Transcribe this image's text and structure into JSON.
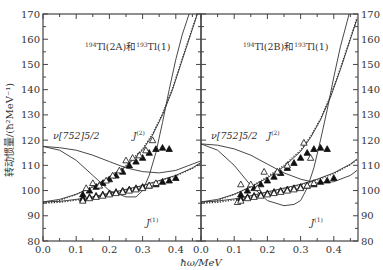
{
  "chart_data": [
    {
      "type": "scatter",
      "title": "194Tl(2A)和193Tl(1)",
      "title_parts": {
        "a_sup": "194",
        "a": "Tl(2A)和",
        "b_sup": "193",
        "b": "Tl(1)"
      },
      "xlabel": "ħω/MeV",
      "ylabel": "转动惯量/(ħ²MeV⁻¹)",
      "xlim": [
        0.0,
        0.48
      ],
      "ylim": [
        80,
        170
      ],
      "xticks": [
        "0.0",
        "0.1",
        "0.2",
        "0.3",
        "0.4"
      ],
      "yticks": [
        "80",
        "90",
        "100",
        "110",
        "120",
        "130",
        "140",
        "150",
        "160",
        "170"
      ],
      "yaxis_side": "left",
      "annotations": [
        {
          "text": "ν[752]5/2",
          "x": 0.03,
          "y": 120.5
        },
        {
          "text": "J(2)",
          "x": 0.27,
          "y": 120.5
        },
        {
          "text": "J(1)",
          "x": 0.31,
          "y": 86
        }
      ],
      "series": [
        {
          "name": "J(2) filled",
          "marker": "filled-triangle",
          "x": [
            0.12,
            0.14,
            0.16,
            0.18,
            0.2,
            0.22,
            0.24,
            0.26,
            0.28,
            0.3,
            0.32,
            0.34,
            0.36,
            0.38
          ],
          "y": [
            98.5,
            100,
            101.5,
            103,
            104.5,
            106,
            107.5,
            110,
            111.5,
            113,
            115,
            116.5,
            117,
            116.5
          ]
        },
        {
          "name": "J(2) open",
          "marker": "open-triangle",
          "x": [
            0.12,
            0.13,
            0.15,
            0.17,
            0.19,
            0.21,
            0.23,
            0.25,
            0.27,
            0.29,
            0.31,
            0.33
          ],
          "y": [
            96.5,
            101,
            103,
            102,
            104,
            106,
            108,
            112,
            113,
            114,
            116,
            120
          ]
        },
        {
          "name": "J(1) filled",
          "marker": "filled-triangle",
          "x": [
            0.12,
            0.14,
            0.16,
            0.18,
            0.2,
            0.22,
            0.24,
            0.26,
            0.28,
            0.3,
            0.32,
            0.34,
            0.36,
            0.38,
            0.4
          ],
          "y": [
            97,
            97.5,
            98,
            98.5,
            99,
            99.5,
            100,
            100.5,
            101,
            101.5,
            102,
            102.5,
            103.5,
            104,
            105
          ]
        },
        {
          "name": "J(1) open",
          "marker": "open-triangle",
          "x": [
            0.12,
            0.14,
            0.16,
            0.18,
            0.2,
            0.22,
            0.24,
            0.26,
            0.28,
            0.3,
            0.32,
            0.34
          ],
          "y": [
            96,
            97,
            97.5,
            98,
            98.5,
            99,
            99.5,
            100,
            100.5,
            101,
            102,
            103
          ]
        }
      ],
      "curves": [
        {
          "name": "ν[752]5/2 J(1)",
          "style": "solid",
          "x": [
            0.0,
            0.05,
            0.1,
            0.15,
            0.2,
            0.25,
            0.3,
            0.35,
            0.4,
            0.45,
            0.48
          ],
          "y": [
            117.5,
            117,
            116,
            114,
            111.5,
            109,
            107.5,
            107,
            108,
            110.5,
            112
          ]
        },
        {
          "name": "ν[752]5/2 J(2)",
          "style": "solid",
          "x": [
            0.0,
            0.05,
            0.1,
            0.15,
            0.2,
            0.25,
            0.28,
            0.3,
            0.32,
            0.34,
            0.36,
            0.38,
            0.4,
            0.42,
            0.44,
            0.46,
            0.48
          ],
          "y": [
            117.5,
            116,
            112,
            106,
            100,
            97.5,
            97.5,
            100,
            106,
            115,
            127,
            140,
            152,
            162,
            170,
            178,
            186
          ]
        },
        {
          "name": "J(1) fit",
          "style": "solid",
          "x": [
            0.0,
            0.05,
            0.1,
            0.15,
            0.2,
            0.25,
            0.3,
            0.35,
            0.4,
            0.45,
            0.48
          ],
          "y": [
            95.5,
            95.7,
            96.5,
            97.5,
            99,
            100.5,
            102,
            104,
            106,
            109,
            111.5
          ]
        },
        {
          "name": "J(1) fit dotted",
          "style": "dotted",
          "x": [
            0.0,
            0.05,
            0.1,
            0.15,
            0.2,
            0.25,
            0.3,
            0.35,
            0.4,
            0.45,
            0.48
          ],
          "y": [
            95,
            95.3,
            96.2,
            97.3,
            98.8,
            100.3,
            101.8,
            103.8,
            105.8,
            108.8,
            111.2
          ]
        },
        {
          "name": "J(2) fit",
          "style": "solid",
          "x": [
            0.0,
            0.05,
            0.1,
            0.15,
            0.2,
            0.25,
            0.3,
            0.33,
            0.36,
            0.39,
            0.42,
            0.45,
            0.48
          ],
          "y": [
            95.5,
            96.5,
            98.5,
            101.5,
            105,
            109.5,
            116,
            122,
            130,
            140,
            152,
            164,
            176
          ]
        },
        {
          "name": "J(2) fit dotted",
          "style": "dotted",
          "x": [
            0.0,
            0.05,
            0.1,
            0.15,
            0.2,
            0.25,
            0.3,
            0.33,
            0.36,
            0.39,
            0.42,
            0.45,
            0.48
          ],
          "y": [
            95,
            96,
            98.5,
            101.5,
            105.5,
            110,
            116.5,
            122.5,
            130.5,
            140.5,
            152.5,
            164.5,
            176.5
          ]
        }
      ]
    },
    {
      "type": "scatter",
      "title": "194Tl(2B)和193Tl(1)",
      "title_parts": {
        "a_sup": "194",
        "a": "Tl(2B)和",
        "b_sup": "193",
        "b": "Tl(1)"
      },
      "xlabel": "ħω/MeV",
      "ylabel": "",
      "xlim": [
        0.0,
        0.47
      ],
      "ylim": [
        80,
        170
      ],
      "xticks": [
        "0.0",
        "0.1",
        "0.2",
        "0.3",
        "0.4"
      ],
      "yticks": [
        "80",
        "90",
        "100",
        "110",
        "120",
        "130",
        "140",
        "150",
        "160",
        "170"
      ],
      "yaxis_side": "right",
      "annotations": [
        {
          "text": "ν[752]5/2",
          "x": 0.03,
          "y": 120.5
        },
        {
          "text": "J(2)",
          "x": 0.2,
          "y": 120.5
        },
        {
          "text": "J(1)",
          "x": 0.33,
          "y": 86
        }
      ],
      "series": [
        {
          "name": "J(2) filled",
          "marker": "filled-triangle",
          "x": [
            0.12,
            0.14,
            0.16,
            0.18,
            0.2,
            0.22,
            0.24,
            0.26,
            0.28,
            0.3,
            0.32,
            0.34,
            0.36,
            0.38
          ],
          "y": [
            98.5,
            100,
            101,
            102.5,
            104,
            105.5,
            107,
            109,
            111,
            113,
            115,
            116.5,
            117,
            116.5
          ]
        },
        {
          "name": "J(2) open",
          "marker": "open-triangle",
          "x": [
            0.11,
            0.12,
            0.15,
            0.17,
            0.19,
            0.23,
            0.26,
            0.31,
            0.33
          ],
          "y": [
            95.5,
            102.5,
            102.5,
            101,
            107.5,
            107.5,
            110,
            119,
            113
          ]
        },
        {
          "name": "J(1) filled",
          "marker": "filled-triangle",
          "x": [
            0.12,
            0.14,
            0.16,
            0.18,
            0.2,
            0.22,
            0.24,
            0.26,
            0.28,
            0.3,
            0.32,
            0.34,
            0.36,
            0.38,
            0.4
          ],
          "y": [
            97,
            97.5,
            98,
            98.5,
            99,
            99.5,
            100,
            100.5,
            101,
            101.5,
            102,
            102.5,
            103.5,
            104,
            105
          ]
        },
        {
          "name": "J(1) open",
          "marker": "open-triangle",
          "x": [
            0.12,
            0.14,
            0.16,
            0.18,
            0.2,
            0.22,
            0.24,
            0.26,
            0.28,
            0.3,
            0.32,
            0.34
          ],
          "y": [
            96,
            97,
            97.5,
            98,
            98.5,
            99,
            99.5,
            100,
            100.5,
            101,
            102,
            103
          ]
        }
      ],
      "curves": [
        {
          "name": "ν[752]5/2 J(1)",
          "style": "solid",
          "x": [
            0.0,
            0.05,
            0.1,
            0.15,
            0.2,
            0.25,
            0.3,
            0.35,
            0.4,
            0.45,
            0.47
          ],
          "y": [
            118.5,
            118,
            116.5,
            114,
            110.5,
            107,
            104.5,
            103,
            103.5,
            106,
            108
          ]
        },
        {
          "name": "ν[752]5/2 J(2)",
          "style": "solid",
          "x": [
            0.0,
            0.05,
            0.1,
            0.15,
            0.2,
            0.25,
            0.28,
            0.3,
            0.32,
            0.34,
            0.36,
            0.38,
            0.4,
            0.42,
            0.44,
            0.46,
            0.47
          ],
          "y": [
            118.5,
            116,
            110,
            102,
            96,
            94,
            94.5,
            96,
            101,
            109,
            120,
            132,
            145,
            157,
            167,
            177,
            182
          ]
        },
        {
          "name": "J(1) fit",
          "style": "solid",
          "x": [
            0.0,
            0.05,
            0.1,
            0.15,
            0.2,
            0.25,
            0.3,
            0.35,
            0.4,
            0.45,
            0.47
          ],
          "y": [
            95.5,
            95.8,
            96.7,
            98,
            99.5,
            101,
            102.5,
            104.5,
            107,
            110.5,
            112.5
          ]
        },
        {
          "name": "J(1) fit dotted",
          "style": "dotted",
          "x": [
            0.0,
            0.05,
            0.1,
            0.15,
            0.2,
            0.25,
            0.3,
            0.35,
            0.4,
            0.45,
            0.47
          ],
          "y": [
            95,
            95.3,
            96.3,
            97.6,
            99.1,
            100.7,
            102.2,
            104.2,
            106.7,
            110.2,
            112.2
          ]
        },
        {
          "name": "J(2) fit",
          "style": "solid",
          "x": [
            0.0,
            0.05,
            0.1,
            0.15,
            0.2,
            0.25,
            0.3,
            0.33,
            0.36,
            0.39,
            0.42,
            0.45,
            0.47
          ],
          "y": [
            95.5,
            96.5,
            98.5,
            101.5,
            105,
            109.5,
            115.5,
            121,
            128,
            137,
            148,
            160,
            168
          ]
        },
        {
          "name": "J(2) fit dotted",
          "style": "dotted",
          "x": [
            0.0,
            0.05,
            0.1,
            0.15,
            0.2,
            0.25,
            0.3,
            0.33,
            0.36,
            0.39,
            0.42,
            0.45,
            0.47
          ],
          "y": [
            95,
            96,
            98.5,
            101.5,
            105.5,
            110,
            116,
            121.5,
            128.5,
            137.5,
            148.5,
            160.5,
            168.5
          ]
        }
      ]
    }
  ],
  "shared": {
    "ylabel": "转动惯量/(ħ²MeV⁻¹)",
    "xlabel": "ħω/MeV"
  }
}
